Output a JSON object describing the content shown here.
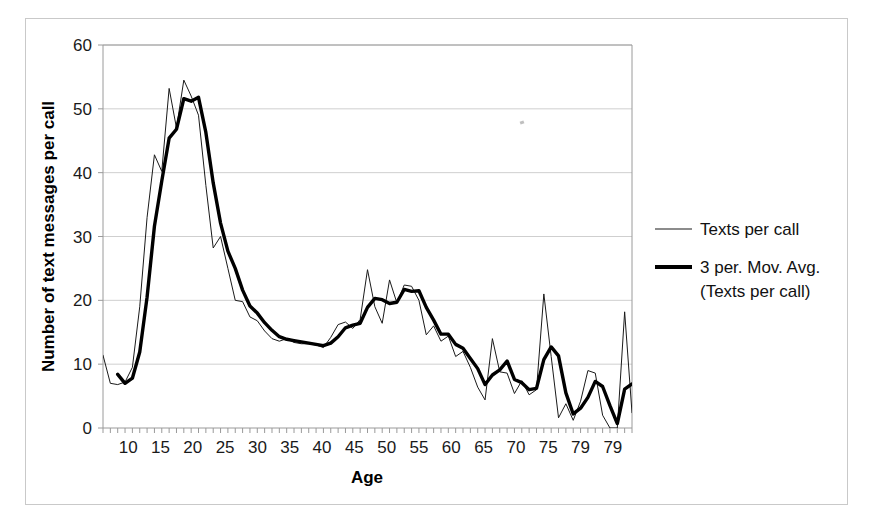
{
  "figure": {
    "background_color": "#ffffff",
    "frame_color": "#c9c9c9",
    "top_caption_fragment": ""
  },
  "chart_data": {
    "type": "line",
    "title": "",
    "subtitle": "",
    "xlabel": "Age",
    "ylabel": "Number of text messages per call",
    "xlim": [
      10,
      82
    ],
    "ylim": [
      0,
      60
    ],
    "grid": "horizontal-only",
    "gridline_color": "#cfcfcf",
    "axis_color": "#9a9a9a",
    "legend_position": "right-outside",
    "y_ticks": [
      0,
      10,
      20,
      30,
      40,
      50,
      60
    ],
    "y_tick_labels": [
      "0",
      "10",
      "20",
      "30",
      "40",
      "50",
      "60"
    ],
    "x_ticks": [
      10,
      15,
      20,
      25,
      30,
      35,
      40,
      45,
      50,
      55,
      60,
      65,
      70,
      75,
      79,
      79
    ],
    "x_tick_labels": [
      "10",
      "15",
      "20",
      "25",
      "30",
      "35",
      "40",
      "45",
      "50",
      "55",
      "60",
      "65",
      "70",
      "75",
      "79",
      "79"
    ],
    "x_minor_tick_step": 1,
    "x": [
      10,
      11,
      12,
      13,
      14,
      15,
      16,
      17,
      18,
      19,
      20,
      21,
      22,
      23,
      24,
      25,
      26,
      27,
      28,
      29,
      30,
      31,
      32,
      33,
      34,
      35,
      36,
      37,
      38,
      39,
      40,
      41,
      42,
      43,
      44,
      45,
      46,
      47,
      48,
      49,
      50,
      51,
      52,
      53,
      54,
      55,
      56,
      57,
      58,
      59,
      60,
      61,
      62,
      63,
      64,
      65,
      66,
      67,
      68,
      69,
      70,
      71,
      72,
      73,
      74,
      75,
      76,
      77,
      78,
      79,
      80,
      81,
      82
    ],
    "series": [
      {
        "name": "Texts per call",
        "style": "thin",
        "color": "#1a1a1a",
        "linewidth": 1.0,
        "values": [
          11.4,
          7.0,
          6.8,
          7.2,
          9.5,
          19.0,
          33.0,
          42.8,
          40.2,
          53.2,
          47.0,
          54.5,
          52.0,
          49.0,
          38.0,
          28.2,
          30.0,
          25.0,
          20.0,
          19.8,
          17.4,
          16.8,
          15.2,
          14.0,
          13.6,
          14.0,
          13.4,
          13.2,
          13.2,
          13.0,
          12.6,
          14.2,
          16.2,
          16.6,
          15.6,
          17.0,
          24.8,
          19.0,
          16.4,
          23.2,
          19.6,
          22.4,
          22.2,
          20.0,
          14.6,
          16.0,
          13.6,
          14.4,
          11.2,
          12.0,
          9.5,
          6.4,
          4.4,
          14.0,
          8.8,
          8.6,
          5.4,
          7.4,
          5.2,
          6.0,
          21.0,
          11.2,
          1.6,
          3.8,
          1.2,
          4.2,
          9.0,
          8.6,
          2.0,
          0.0,
          0.0,
          18.2,
          2.4
        ]
      },
      {
        "name": "3 per. Mov. Avg. (Texts per call)",
        "style": "thick",
        "color": "#000000",
        "linewidth": 3.4,
        "values": [
          null,
          null,
          8.4,
          7.0,
          7.8,
          11.9,
          20.5,
          31.6,
          38.7,
          45.4,
          46.8,
          51.6,
          51.2,
          51.8,
          46.3,
          38.4,
          32.1,
          27.7,
          25.0,
          21.6,
          19.1,
          18.0,
          16.5,
          15.3,
          14.3,
          13.9,
          13.7,
          13.5,
          13.3,
          13.1,
          12.9,
          13.3,
          14.3,
          15.7,
          16.1,
          16.4,
          18.9,
          20.3,
          20.1,
          19.5,
          19.7,
          21.7,
          21.4,
          21.5,
          18.9,
          16.9,
          14.7,
          14.7,
          13.1,
          12.5,
          10.9,
          9.3,
          6.8,
          8.3,
          9.1,
          10.5,
          7.6,
          7.1,
          6.0,
          6.2,
          10.7,
          12.7,
          11.3,
          5.5,
          2.2,
          3.1,
          4.8,
          7.3,
          6.5,
          3.5,
          0.7,
          6.1,
          6.9
        ]
      }
    ],
    "annotations": [
      {
        "kind": "peak",
        "series": "Texts per call",
        "x": 21,
        "y": 54.5
      },
      {
        "kind": "peak",
        "series": "3 per. Mov. Avg. (Texts per call)",
        "x": 23,
        "y": 51.8
      },
      {
        "kind": "secondary-bump",
        "series": "3 per. Mov. Avg. (Texts per call)",
        "x": 51,
        "y": 21.7
      }
    ],
    "legend_entries": [
      {
        "label": "Texts per call",
        "style": "thin"
      },
      {
        "label": "3 per. Mov. Avg.",
        "label_line2": "(Texts per call)",
        "style": "thick"
      }
    ]
  }
}
